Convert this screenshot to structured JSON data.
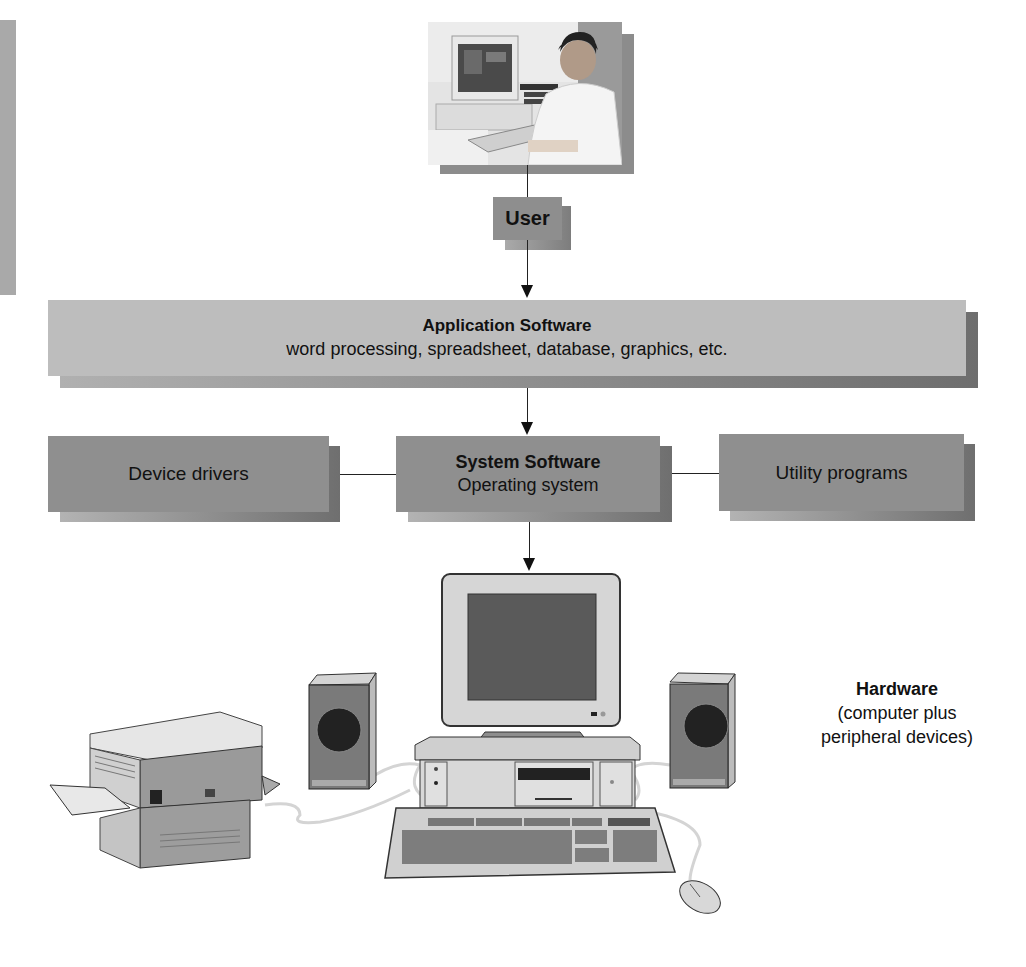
{
  "diagram": {
    "user": {
      "label": "User",
      "image": "user-at-computer-photo"
    },
    "application_software": {
      "title": "Application Software",
      "subtitle": "word processing, spreadsheet, database, graphics, etc."
    },
    "device_drivers": {
      "label": "Device drivers"
    },
    "system_software": {
      "title": "System Software",
      "subtitle": "Operating system"
    },
    "utility_programs": {
      "label": "Utility programs"
    },
    "hardware": {
      "title": "Hardware",
      "subtitle_line1": "(computer plus",
      "subtitle_line2": "peripheral devices)",
      "devices": [
        "printer",
        "speaker-left",
        "monitor",
        "system-unit",
        "speaker-right",
        "keyboard",
        "mouse"
      ]
    },
    "flow": [
      "User",
      "Application Software",
      "System Software",
      "Hardware"
    ],
    "connections": [
      {
        "from": "Device drivers",
        "to": "System Software"
      },
      {
        "from": "System Software",
        "to": "Utility programs"
      }
    ]
  },
  "colors": {
    "box_light": "#bdbdbd",
    "box_dark": "#8f8f8f",
    "shadow": "#6f6f6f",
    "text": "#111111"
  }
}
